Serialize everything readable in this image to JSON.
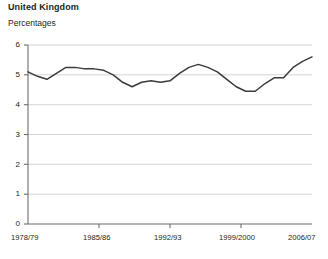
{
  "header": {
    "title": "United Kingdom",
    "subtitle": "Percentages"
  },
  "chart_data": {
    "type": "line",
    "title": "United Kingdom",
    "subtitle": "Percentages",
    "xlabel": "",
    "ylabel": "Percentages",
    "ylim": [
      0,
      6
    ],
    "yticks": [
      0,
      1,
      2,
      3,
      4,
      5,
      6
    ],
    "ytick_labels": [
      "0",
      "1",
      "2",
      "3",
      "4",
      "5",
      "6"
    ],
    "grid": "horizontal",
    "legend": "none",
    "line_color": "#3b3b3b",
    "gridline_color": "#c9c9c9",
    "axis_color": "#6e6e6e",
    "xtick_labels": [
      "1978/79",
      "1985/86",
      "1992/93",
      "1999/2000",
      "2006/07"
    ],
    "xtick_positions": [
      0,
      7,
      14,
      21,
      28
    ],
    "x": [
      "1978/79",
      "1979/80",
      "1980/81",
      "1981/82",
      "1982/83",
      "1983/84",
      "1984/85",
      "1985/86",
      "1986/87",
      "1987/88",
      "1988/89",
      "1989/90",
      "1990/91",
      "1991/92",
      "1992/93",
      "1993/94",
      "1994/95",
      "1995/96",
      "1996/97",
      "1997/98",
      "1998/99",
      "1999/2000",
      "2000/01",
      "2001/02",
      "2002/03",
      "2003/04",
      "2004/05",
      "2005/06",
      "2006/07"
    ],
    "values": [
      5.1,
      4.95,
      4.85,
      5.05,
      5.25,
      5.25,
      5.2,
      5.2,
      5.15,
      5.0,
      4.75,
      4.6,
      4.75,
      4.8,
      4.75,
      4.8,
      5.05,
      5.25,
      5.35,
      5.25,
      5.1,
      4.85,
      4.6,
      4.45,
      4.45,
      4.7,
      4.9,
      4.9,
      5.25
    ],
    "series": [
      {
        "name": "United Kingdom",
        "values": [
          5.1,
          4.95,
          4.85,
          5.05,
          5.25,
          5.25,
          5.2,
          5.2,
          5.15,
          5.0,
          4.75,
          4.6,
          4.75,
          4.8,
          4.75,
          4.8,
          5.05,
          5.25,
          5.35,
          5.25,
          5.1,
          4.85,
          4.6,
          4.45,
          4.45,
          4.7,
          4.9,
          4.9,
          5.25
        ]
      }
    ],
    "extra_points": [
      {
        "x": "2007/08",
        "value": 5.45
      },
      {
        "x": "2008/09",
        "value": 5.6
      }
    ]
  }
}
